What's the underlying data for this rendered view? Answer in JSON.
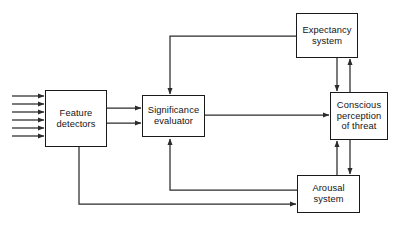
{
  "diagram": {
    "type": "block-flow-diagram",
    "background_color": "#ffffff",
    "line_color": "#2b2b2b",
    "text_color": "#141414",
    "nodes": [
      {
        "id": "feature_detectors",
        "label": "Feature\ndetectors",
        "x": 45,
        "y": 90,
        "w": 62,
        "h": 57
      },
      {
        "id": "significance_evaluator",
        "label": "Significance\nevaluator",
        "x": 142,
        "y": 95,
        "w": 63,
        "h": 42
      },
      {
        "id": "expectancy_system",
        "label": "Expectancy\nsystem",
        "x": 296,
        "y": 13,
        "w": 62,
        "h": 45
      },
      {
        "id": "conscious_perception",
        "label": "Conscious\nperception\nof threat",
        "x": 330,
        "y": 92,
        "w": 58,
        "h": 48
      },
      {
        "id": "arousal_system",
        "label": "Arousal\nsystem",
        "x": 297,
        "y": 175,
        "w": 63,
        "h": 38
      }
    ],
    "input_arrows": {
      "count": 6,
      "from_x": 12,
      "to_x": 45,
      "y_values": [
        96,
        104,
        112,
        120,
        128,
        136
      ]
    },
    "edges": [
      {
        "id": "feature-to-significance-upper",
        "from": "feature_detectors",
        "to": "significance_evaluator"
      },
      {
        "id": "feature-to-significance-lower",
        "from": "feature_detectors",
        "to": "significance_evaluator"
      },
      {
        "id": "significance-to-conscious",
        "from": "significance_evaluator",
        "to": "conscious_perception"
      },
      {
        "id": "expectancy-to-significance",
        "from": "expectancy_system",
        "to": "significance_evaluator"
      },
      {
        "id": "expectancy-to-conscious",
        "from": "expectancy_system",
        "to": "conscious_perception"
      },
      {
        "id": "conscious-to-expectancy",
        "from": "conscious_perception",
        "to": "expectancy_system"
      },
      {
        "id": "arousal-to-conscious",
        "from": "arousal_system",
        "to": "conscious_perception"
      },
      {
        "id": "conscious-to-arousal",
        "from": "conscious_perception",
        "to": "arousal_system"
      },
      {
        "id": "arousal-to-significance",
        "from": "arousal_system",
        "to": "significance_evaluator"
      },
      {
        "id": "feature-to-arousal",
        "from": "feature_detectors",
        "to": "arousal_system"
      }
    ]
  }
}
